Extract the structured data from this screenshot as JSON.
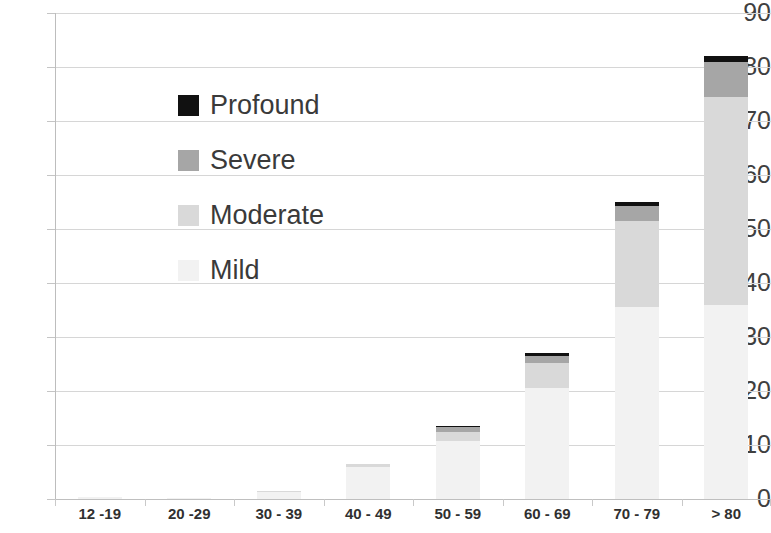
{
  "chart_data": {
    "type": "bar",
    "subtype": "stacked-bar",
    "title": "",
    "xlabel": "",
    "ylabel": "",
    "ylim": [
      0,
      90
    ],
    "ytick_step": 10,
    "yticks": [
      "90",
      "80",
      "70",
      "60",
      "50",
      "40",
      "30",
      "20",
      "10",
      "0"
    ],
    "grid": true,
    "grid_axis": "y",
    "legend_position": "inside-upper-left",
    "stack_order_bottom_to_top": [
      "Mild",
      "Moderate",
      "Severe",
      "Profound"
    ],
    "categories": [
      "12 -19",
      "20 -29",
      "30 - 39",
      "40 - 49",
      "50 - 59",
      "60 - 69",
      "70 - 79",
      "> 80"
    ],
    "series": [
      {
        "name": "Mild",
        "color": "#f2f2f2",
        "values": [
          0.3,
          0.2,
          1.3,
          6.0,
          10.8,
          20.5,
          35.5,
          36.0
        ]
      },
      {
        "name": "Moderate",
        "color": "#d9d9d9",
        "values": [
          0.0,
          0.0,
          0.2,
          0.5,
          1.7,
          4.7,
          15.9,
          38.5
        ]
      },
      {
        "name": "Severe",
        "color": "#a6a6a6",
        "values": [
          0.0,
          0.0,
          0.0,
          0.0,
          0.9,
          1.3,
          2.8,
          6.5
        ]
      },
      {
        "name": "Profound",
        "color": "#111111",
        "values": [
          0.0,
          0.0,
          0.0,
          0.0,
          0.2,
          0.5,
          0.8,
          1.0
        ]
      }
    ],
    "totals": [
      0.3,
      0.2,
      1.5,
      6.5,
      13.6,
      27.0,
      55.0,
      82.0
    ]
  },
  "legend": {
    "items": [
      {
        "label": "Profound",
        "color": "#111111"
      },
      {
        "label": "Severe",
        "color": "#a6a6a6"
      },
      {
        "label": "Moderate",
        "color": "#d9d9d9"
      },
      {
        "label": "Mild",
        "color": "#f2f2f2"
      }
    ]
  }
}
